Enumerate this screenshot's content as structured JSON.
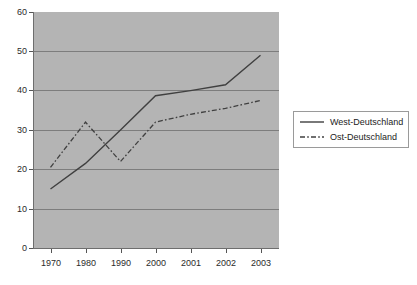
{
  "chart_data": {
    "type": "line",
    "title": "",
    "subtitle": "",
    "xlabel": "",
    "ylabel": "",
    "categories": [
      "1970",
      "1980",
      "1990",
      "2000",
      "2001",
      "2002",
      "2003"
    ],
    "series": [
      {
        "name": "West-Deutschland",
        "style": "solid",
        "color": "#404040",
        "values": [
          15,
          21.5,
          30,
          38.7,
          40,
          41.5,
          49
        ]
      },
      {
        "name": "Ost-Deutschland",
        "style": "dash-dot",
        "color": "#404040",
        "values": [
          20.5,
          32,
          22,
          32,
          34,
          35.5,
          37.5
        ]
      }
    ],
    "ylim": [
      0,
      60
    ],
    "yticks": [
      0,
      10,
      20,
      30,
      40,
      50,
      60
    ],
    "ytick_labels": [
      "0",
      "10",
      "20",
      "30",
      "40",
      "50",
      "60"
    ],
    "grid": true,
    "grid_axis": "y",
    "legend_position": "right",
    "plot_background": "#b4b4b4",
    "figure_background": "#ffffff",
    "axis_color": "#6e6e6e",
    "gridline_color": "#7d7d7d"
  },
  "legend": {
    "items": [
      {
        "label": "West-Deutschland"
      },
      {
        "label": "Ost-Deutschland"
      }
    ]
  }
}
